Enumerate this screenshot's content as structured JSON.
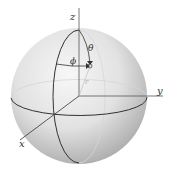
{
  "diagram": {
    "axes": {
      "z": "z",
      "y": "y",
      "x": "x"
    },
    "angles": {
      "theta": "θ",
      "phi": "ϕ"
    },
    "radius": "r",
    "colors": {
      "sphere_light": "#f4f4f4",
      "sphere_dark": "#a8a8a8",
      "line": "#333333",
      "faint_line": "#cfcfcf"
    }
  }
}
